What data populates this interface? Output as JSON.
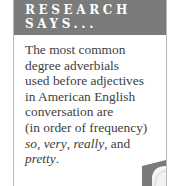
{
  "sidebar_box": {
    "header": {
      "line1": "RESEARCH",
      "line2": "SAYS..."
    },
    "body_lines": [
      "The most common",
      "degree adverbials",
      "used before adjectives",
      "in American English",
      "conversation are",
      "(in order of frequency)"
    ],
    "last_line": {
      "w1": "so",
      "sep1": ", ",
      "w2": "very",
      "sep2": ", ",
      "w3": "really",
      "sep3": ", and"
    },
    "final_line": {
      "w4": "pretty",
      "end": "."
    },
    "colors": {
      "header_bg": "#7b7b7b",
      "header_text": "#ffffff",
      "body_text": "#404040",
      "border": "#b8b8b8"
    }
  }
}
